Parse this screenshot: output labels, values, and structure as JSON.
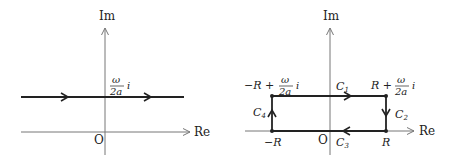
{
  "left_diagram": {
    "axis_im_label": "Im",
    "axis_re_label": "Re",
    "origin_label": "O",
    "line_label": {
      "numerator": "ω",
      "denominator": "2a",
      "suffix": "i"
    }
  },
  "right_diagram": {
    "axis_im_label": "Im",
    "axis_re_label": "Re",
    "origin_label": "O",
    "corner_top_left": {
      "prefix": "−R +",
      "numerator": "ω",
      "denominator": "2a",
      "suffix": "i"
    },
    "corner_top_right": {
      "prefix": "R +",
      "numerator": "ω",
      "denominator": "2a",
      "suffix": "i"
    },
    "corner_bottom_left": "−R",
    "corner_bottom_right": "R",
    "segments": {
      "c1": {
        "letter": "C",
        "sub": "1"
      },
      "c2": {
        "letter": "C",
        "sub": "2"
      },
      "c3": {
        "letter": "C",
        "sub": "3"
      },
      "c4": {
        "letter": "C",
        "sub": "4"
      }
    }
  },
  "colors": {
    "axis": "#777777",
    "contour": "#222222",
    "text": "#222222"
  }
}
